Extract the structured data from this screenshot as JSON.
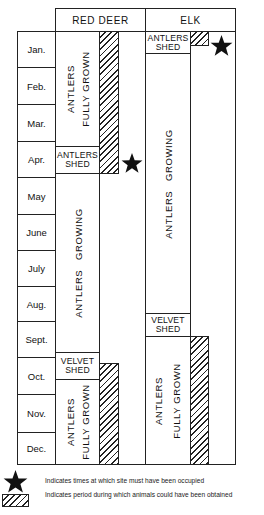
{
  "header": {
    "columns": [
      "RED DEER",
      "ELK"
    ]
  },
  "months": [
    "Jan.",
    "Feb.",
    "Mar.",
    "Apr.",
    "May",
    "June",
    "July",
    "Aug.",
    "Sept.",
    "Oct.",
    "Nov.",
    "Dec."
  ],
  "red_deer": {
    "phases": [
      {
        "label": "ANTLERS FULLY GROWN",
        "line1": "ANTLERS",
        "line2": "FULLY GROWN",
        "period": "Jan.–Mar."
      },
      {
        "label": "ANTLERS SHED",
        "line1": "ANTLERS",
        "line2": "SHED",
        "period": "Apr."
      },
      {
        "label": "ANTLERS GROWING",
        "line1": "ANTLERS   GROWING",
        "period": "May–Sept."
      },
      {
        "label": "VELVET SHED",
        "line1": "VELVET",
        "line2": "SHED",
        "period": "late Sept.–early Oct."
      },
      {
        "label": "ANTLERS FULLY GROWN",
        "line1": "ANTLERS",
        "line2": "FULLY GROWN",
        "period": "Oct.–Dec."
      }
    ],
    "procurement_periods": [
      "Jan.–Apr.",
      "Oct.–Dec."
    ],
    "occupation_marker": "Apr."
  },
  "elk": {
    "phases": [
      {
        "label": "ANTLERS SHED",
        "line1": "ANTLERS",
        "line2": "SHED",
        "period": "Jan."
      },
      {
        "label": "ANTLERS GROWING",
        "line1": "ANTLERS   GROWING",
        "period": "Jan.–Aug."
      },
      {
        "label": "VELVET SHED",
        "line1": "VELVET",
        "line2": "SHED",
        "period": "late Aug.–early Sept."
      },
      {
        "label": "ANTLERS FULLY GROWN",
        "line1": "ANTLERS",
        "line2": "FULLY GROWN",
        "period": "Sept.–Dec."
      }
    ],
    "procurement_periods": [
      "early Jan.",
      "Sept.–Dec."
    ],
    "occupation_marker": "Jan."
  },
  "legend": {
    "star_text": "Indicates  times  at  which  site  must  have  been  occupied",
    "hatch_text": "Indicates  period  during  which   animals  could  have  been  obtained"
  },
  "colors": {
    "line": "#222222",
    "background": "#ffffff",
    "star": "#111111"
  }
}
